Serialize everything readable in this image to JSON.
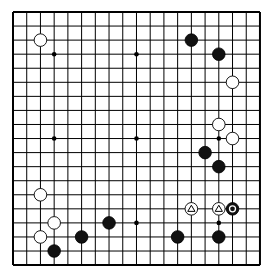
{
  "board": {
    "size": 19,
    "origin_x": 13,
    "origin_y": 12,
    "spacing_x": 13.72,
    "spacing_y": 14.06,
    "line_color": "#000000",
    "background": "#ffffff",
    "star_points": [
      [
        3,
        3
      ],
      [
        9,
        3
      ],
      [
        15,
        3
      ],
      [
        3,
        9
      ],
      [
        9,
        9
      ],
      [
        15,
        9
      ],
      [
        3,
        15
      ],
      [
        9,
        15
      ],
      [
        15,
        15
      ]
    ],
    "stones": [
      {
        "color": "white",
        "col": 2,
        "row": 2
      },
      {
        "color": "black",
        "col": 13,
        "row": 2
      },
      {
        "color": "black",
        "col": 15,
        "row": 3
      },
      {
        "color": "white",
        "col": 16,
        "row": 5
      },
      {
        "color": "white",
        "col": 15,
        "row": 8
      },
      {
        "color": "white",
        "col": 16,
        "row": 9
      },
      {
        "color": "black",
        "col": 14,
        "row": 10
      },
      {
        "color": "black",
        "col": 15,
        "row": 11
      },
      {
        "color": "white",
        "col": 2,
        "row": 13
      },
      {
        "color": "white",
        "col": 13,
        "row": 14,
        "mark": "triangle"
      },
      {
        "color": "white",
        "col": 15,
        "row": 14,
        "mark": "triangle"
      },
      {
        "color": "black",
        "col": 16,
        "row": 14,
        "mark": "circle"
      },
      {
        "color": "white",
        "col": 3,
        "row": 15
      },
      {
        "color": "black",
        "col": 7,
        "row": 15
      },
      {
        "color": "white",
        "col": 2,
        "row": 16
      },
      {
        "color": "black",
        "col": 5,
        "row": 16
      },
      {
        "color": "black",
        "col": 12,
        "row": 16
      },
      {
        "color": "black",
        "col": 15,
        "row": 16
      },
      {
        "color": "black",
        "col": 3,
        "row": 17
      }
    ]
  }
}
